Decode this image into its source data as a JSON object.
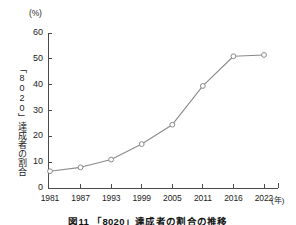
{
  "figure": {
    "unit_label": "(%)",
    "y_axis_title": "「8020」達成者の割合",
    "x_unit_label": "(年)",
    "caption": "図11 「8020」達成者の割合の推移"
  },
  "colors": {
    "line": "#8a8a8a",
    "marker_stroke": "#8a8a8a",
    "marker_fill": "#ffffff",
    "axis": "#4a4a4a",
    "text": "#1c1c1c",
    "background": "#ffffff"
  },
  "chart_data": {
    "type": "line",
    "title": "図11 「8020」達成者の割合の推移",
    "xlabel": "(年)",
    "ylabel": "「8020」達成者の割合",
    "unit": "%",
    "categories": [
      "1981",
      "1987",
      "1993",
      "1999",
      "2005",
      "2011",
      "2016",
      "2022"
    ],
    "values": [
      6.5,
      8.0,
      11.0,
      17.0,
      24.5,
      39.5,
      51.0,
      51.5
    ],
    "ylim": [
      0,
      60
    ],
    "yticks": [
      "0",
      "10",
      "20",
      "30",
      "40",
      "50",
      "60"
    ],
    "ytick_values": [
      0,
      10,
      20,
      30,
      40,
      50,
      60
    ],
    "grid": false,
    "legend": false,
    "marker": "open-circle",
    "series": [
      {
        "name": "「8020」達成者の割合",
        "values": [
          6.5,
          8.0,
          11.0,
          17.0,
          24.5,
          39.5,
          51.0,
          51.5
        ]
      }
    ]
  }
}
